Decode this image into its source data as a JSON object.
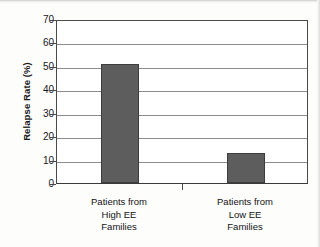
{
  "chart_data": {
    "type": "bar",
    "title": "",
    "xlabel": "",
    "ylabel": "Relapse Rate (%)",
    "categories": [
      "Patients from High EE Families",
      "Patients from Low EE Families"
    ],
    "category_lines": [
      [
        "Patients from",
        "High EE",
        "Families"
      ],
      [
        "Patients from",
        "Low EE",
        "Families"
      ]
    ],
    "values": [
      51,
      13
    ],
    "ylim": [
      0,
      70
    ],
    "ytick_values": [
      0,
      10,
      20,
      30,
      40,
      50,
      60,
      70
    ],
    "ytick_labels": [
      "0",
      "10",
      "20",
      "30",
      "40",
      "50",
      "60",
      "70"
    ],
    "grid": "horizontal",
    "legend": "none",
    "bar_color": "#5d5d5d",
    "bar_edge_color": "#3d3d3d",
    "gridline_color": "#8d8d8d",
    "axis_color": "#4a4a4a",
    "background_color": "#ffffff"
  }
}
